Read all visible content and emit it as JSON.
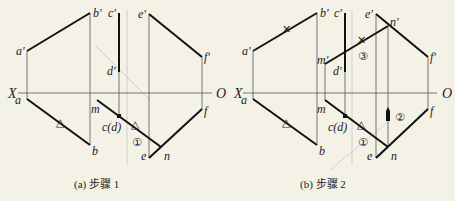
{
  "panels": [
    {
      "id": "a",
      "caption": "(a) 步骤 1",
      "axis": {
        "x_label": "X",
        "o_label": "O"
      },
      "labels": {
        "a_prime": "a'",
        "b_prime": "b'",
        "c_prime": "c'",
        "d_prime": "d'",
        "e_prime": "e'",
        "f_prime": "f'",
        "a": "a",
        "b": "b",
        "m": "m",
        "cd": "c(d)",
        "e": "e",
        "n": "n",
        "f": "f"
      },
      "steps": {
        "one": "①"
      }
    },
    {
      "id": "b",
      "caption": "(b) 步骤 2",
      "axis": {
        "x_label": "X",
        "o_label": "O"
      },
      "labels": {
        "a_prime": "a'",
        "b_prime": "b'",
        "c_prime": "c'",
        "d_prime": "d'",
        "e_prime": "e'",
        "n_prime": "n'",
        "f_prime": "f'",
        "m_prime": "m'",
        "a": "a",
        "b": "b",
        "m": "m",
        "cd": "c(d)",
        "e": "e",
        "n": "n",
        "f": "f"
      },
      "steps": {
        "one": "①",
        "two": "②",
        "three": "③"
      }
    }
  ]
}
